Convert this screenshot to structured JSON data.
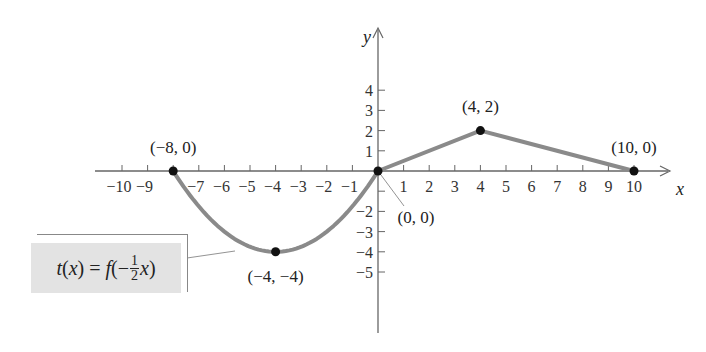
{
  "chart_data": {
    "type": "line",
    "title": "",
    "xlabel": "x",
    "ylabel": "y",
    "xlim": [
      -10.5,
      11
    ],
    "ylim": [
      -6,
      5
    ],
    "grid": false,
    "x_ticks": [
      -10,
      -9,
      -8,
      -7,
      -6,
      -5,
      -4,
      -3,
      -2,
      -1,
      1,
      2,
      3,
      4,
      5,
      6,
      7,
      8,
      9,
      10
    ],
    "x_tick_labels": [
      "−10",
      "−9",
      "",
      "−7",
      "−6",
      "−5",
      "−4",
      "−3",
      "−2",
      "−1",
      "1",
      "2",
      "3",
      "4",
      "5",
      "6",
      "7",
      "8",
      "9",
      "10"
    ],
    "y_ticks": [
      -5,
      -4,
      -3,
      -2,
      -1,
      1,
      2,
      3,
      4
    ],
    "y_tick_labels": [
      "−5",
      "−4",
      "−3",
      "−2",
      "",
      "1",
      "2",
      "3",
      "4"
    ],
    "series": [
      {
        "name": "t(x) = f(−½x)",
        "segments": [
          {
            "shape": "parabola",
            "from": [
              -8,
              0
            ],
            "vertex": [
              -4,
              -4
            ],
            "to": [
              0,
              0
            ]
          },
          {
            "shape": "line",
            "from": [
              0,
              0
            ],
            "to": [
              4,
              2
            ]
          },
          {
            "shape": "line",
            "from": [
              4,
              2
            ],
            "to": [
              10,
              0
            ]
          }
        ],
        "color": "#8a8a8a"
      }
    ],
    "points": [
      {
        "x": -8,
        "y": 0,
        "label": "(−8, 0)"
      },
      {
        "x": -4,
        "y": -4,
        "label": "(−4, −4)"
      },
      {
        "x": 0,
        "y": 0,
        "label": "(0, 0)"
      },
      {
        "x": 4,
        "y": 2,
        "label": "(4, 2)"
      },
      {
        "x": 10,
        "y": 0,
        "label": "(10, 0)"
      }
    ],
    "annotation": {
      "text_prefix": "t(x) = f(−",
      "fraction_num": "1",
      "fraction_den": "2",
      "text_suffix": "x)",
      "box_color": "#e3e3e3"
    }
  },
  "colors": {
    "curve": "#8a8a8a",
    "axis": "#666666",
    "point": "#111111"
  }
}
